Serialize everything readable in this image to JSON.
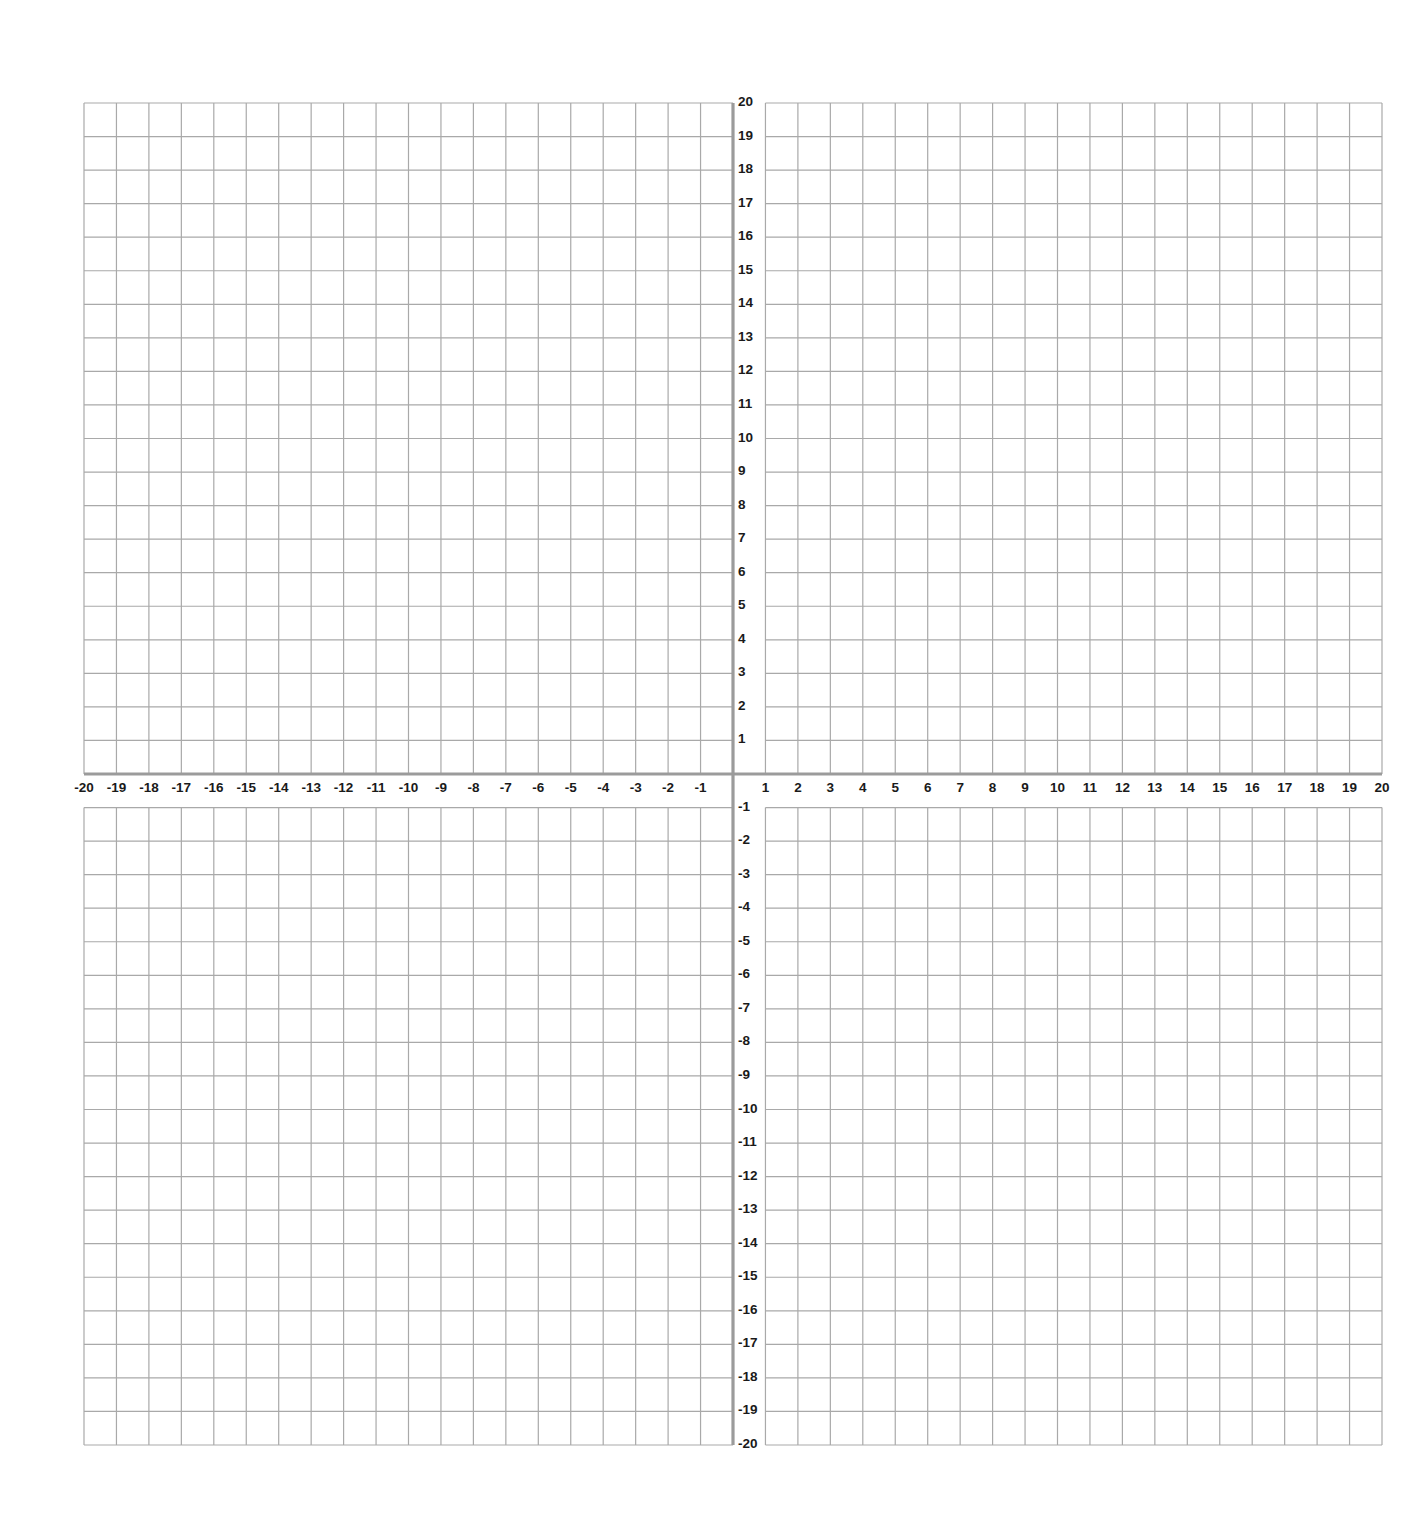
{
  "chart_data": {
    "type": "scatter",
    "title": "",
    "subtitle": "",
    "xlabel": "",
    "ylabel": "",
    "xlim": [
      -20,
      20
    ],
    "ylim": [
      -20,
      20
    ],
    "grid": true,
    "grid_step": 1,
    "legend": null,
    "series": [],
    "x_tick_labels": [
      "-20",
      "-19",
      "-18",
      "-17",
      "-16",
      "-15",
      "-14",
      "-13",
      "-12",
      "-11",
      "-10",
      "-9",
      "-8",
      "-7",
      "-6",
      "-5",
      "-4",
      "-3",
      "-2",
      "-1",
      "1",
      "2",
      "3",
      "4",
      "5",
      "6",
      "7",
      "8",
      "9",
      "10",
      "11",
      "12",
      "13",
      "14",
      "15",
      "16",
      "17",
      "18",
      "19",
      "20"
    ],
    "y_tick_labels": [
      "20",
      "19",
      "18",
      "17",
      "16",
      "15",
      "14",
      "13",
      "12",
      "11",
      "10",
      "9",
      "8",
      "7",
      "6",
      "5",
      "4",
      "3",
      "2",
      "1",
      "-1",
      "-2",
      "-3",
      "-4",
      "-5",
      "-6",
      "-7",
      "-8",
      "-9",
      "-10",
      "-11",
      "-12",
      "-13",
      "-14",
      "-15",
      "-16",
      "-17",
      "-18",
      "-19",
      "-20"
    ]
  },
  "layout": {
    "grid_left": 84,
    "grid_right": 1382,
    "grid_top": 103,
    "grid_bottom": 1445,
    "colors": {
      "gridline": "#a9a9a9",
      "axis": "#9b9b9b",
      "label": "#1a1a1a",
      "background": "#ffffff"
    }
  }
}
